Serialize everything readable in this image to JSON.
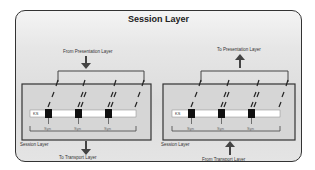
{
  "title": "Session Layer",
  "left": {
    "top_label": "From Presentation Layer",
    "bottom_label": "To Transport Layer",
    "box_label": "Session Layer",
    "bar_label": "KS",
    "sync_labels": [
      "Syn",
      "Syn",
      "Syn"
    ]
  },
  "right": {
    "top_label": "To Presentation Layer",
    "bottom_label": "From Transport Layer",
    "box_label": "Session Layer",
    "bar_label": "KS",
    "sync_labels": [
      "Syn",
      "Syn",
      "Syn"
    ]
  }
}
